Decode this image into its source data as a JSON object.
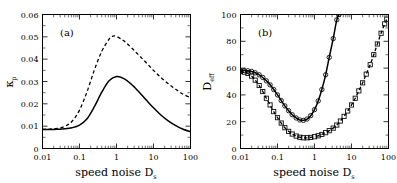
{
  "figure": {
    "panels": [
      "a",
      "b"
    ]
  },
  "chart_data": [
    {
      "type": "line",
      "panel_tag": "(a)",
      "title": "",
      "xlabel": "speed noise D",
      "xlabel_sub": "s",
      "ylabel": "κ",
      "ylabel_sub": "p",
      "xscale": "log",
      "yscale": "linear",
      "xlim": [
        0.01,
        100
      ],
      "ylim": [
        0,
        0.06
      ],
      "xticks": [
        0.01,
        0.1,
        1,
        10,
        100
      ],
      "xtick_labels": [
        "0.01",
        "0.1",
        "1",
        "10",
        "100"
      ],
      "yticks": [
        0,
        0.01,
        0.02,
        0.03,
        0.04,
        0.05,
        0.06
      ],
      "ytick_labels": [
        "0",
        "0.01",
        "0.02",
        "0.03",
        "0.04",
        "0.05",
        "0.06"
      ],
      "grid": false,
      "legend": "none",
      "series": [
        {
          "name": "solid",
          "style": "solid",
          "color": "#000000",
          "x": [
            0.01,
            0.0158,
            0.025,
            0.04,
            0.063,
            0.1,
            0.158,
            0.25,
            0.4,
            0.63,
            1.0,
            1.58,
            2.5,
            4.0,
            6.3,
            10.0,
            15.8,
            25.0,
            40.0,
            63.0,
            100.0
          ],
          "values": [
            0.0085,
            0.0085,
            0.0086,
            0.0088,
            0.0093,
            0.0105,
            0.0132,
            0.0186,
            0.0252,
            0.0303,
            0.0322,
            0.0313,
            0.0288,
            0.0254,
            0.0218,
            0.0182,
            0.015,
            0.0124,
            0.0102,
            0.0086,
            0.0075
          ]
        },
        {
          "name": "dashed",
          "style": "dashed",
          "color": "#000000",
          "x": [
            0.01,
            0.0158,
            0.025,
            0.04,
            0.063,
            0.1,
            0.158,
            0.25,
            0.4,
            0.63,
            0.8,
            1.0,
            1.58,
            2.5,
            4.0,
            6.3,
            10.0,
            15.8,
            25.0,
            40.0,
            63.0,
            100.0
          ],
          "values": [
            0.0086,
            0.0087,
            0.009,
            0.0099,
            0.0122,
            0.0172,
            0.0252,
            0.035,
            0.0435,
            0.049,
            0.0503,
            0.0502,
            0.0482,
            0.0452,
            0.0418,
            0.0385,
            0.035,
            0.0318,
            0.029,
            0.0265,
            0.0243,
            0.0228
          ]
        }
      ]
    },
    {
      "type": "line",
      "panel_tag": "(b)",
      "title": "",
      "xlabel": "speed noise D",
      "xlabel_sub": "s",
      "ylabel": "D",
      "ylabel_sub": "eff",
      "xscale": "log",
      "yscale": "linear",
      "xlim": [
        0.01,
        100
      ],
      "ylim": [
        0,
        100
      ],
      "xticks": [
        0.01,
        0.1,
        1,
        10,
        100
      ],
      "xtick_labels": [
        "0.01",
        "0.1",
        "1",
        "10",
        "100"
      ],
      "yticks": [
        0,
        20,
        40,
        60,
        80,
        100
      ],
      "ytick_labels": [
        "0",
        "20",
        "40",
        "60",
        "80",
        "100"
      ],
      "grid": false,
      "legend": "none",
      "series": [
        {
          "name": "circles-solid",
          "style": "solid",
          "marker": "circle",
          "color": "#000000",
          "x": [
            0.01,
            0.0126,
            0.0158,
            0.02,
            0.025,
            0.032,
            0.04,
            0.05,
            0.063,
            0.079,
            0.1,
            0.126,
            0.158,
            0.2,
            0.25,
            0.32,
            0.4,
            0.5,
            0.63,
            0.79,
            1.0,
            1.26,
            1.58,
            2.0,
            2.5,
            3.2,
            4.0,
            4.6
          ],
          "values": [
            58.0,
            58.2,
            58.0,
            57.5,
            56.5,
            55.0,
            53.0,
            50.5,
            47.5,
            44.0,
            40.0,
            35.8,
            31.8,
            28.2,
            25.2,
            22.8,
            21.3,
            21.0,
            22.0,
            24.5,
            29.0,
            35.5,
            44.0,
            55.0,
            68.0,
            82.0,
            96.0,
            100.0
          ]
        },
        {
          "name": "squares-dashed",
          "style": "dashed",
          "marker": "square",
          "color": "#000000",
          "x": [
            0.01,
            0.0126,
            0.0158,
            0.02,
            0.025,
            0.032,
            0.04,
            0.05,
            0.063,
            0.079,
            0.1,
            0.126,
            0.158,
            0.2,
            0.25,
            0.32,
            0.4,
            0.5,
            0.63,
            0.79,
            1.0,
            1.26,
            1.58,
            2.0,
            2.5,
            3.2,
            4.0,
            5.0,
            6.3,
            7.9,
            10.0,
            12.6,
            15.8,
            20.0,
            25.0,
            32.0,
            40.0,
            50.0,
            63.0,
            79.0,
            90.0
          ],
          "values": [
            57.5,
            57.0,
            56.0,
            54.0,
            51.0,
            47.0,
            42.5,
            37.5,
            32.5,
            27.5,
            23.0,
            19.0,
            15.5,
            12.8,
            10.8,
            9.3,
            8.4,
            8.0,
            8.0,
            8.3,
            8.8,
            9.5,
            10.5,
            11.8,
            13.3,
            15.2,
            17.5,
            20.5,
            24.0,
            28.0,
            32.5,
            37.5,
            43.0,
            49.0,
            55.5,
            62.5,
            70.0,
            78.0,
            86.0,
            93.0,
            96.5
          ]
        }
      ]
    }
  ]
}
